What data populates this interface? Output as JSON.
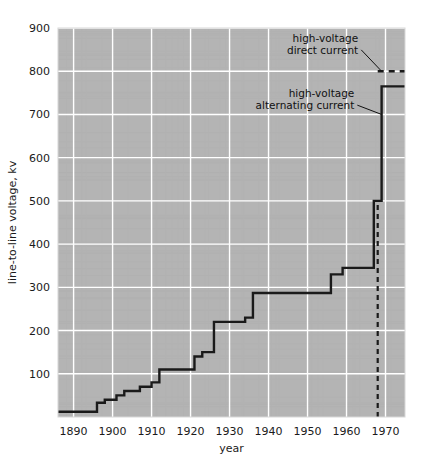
{
  "chart_data": {
    "type": "line",
    "title": "",
    "subtitle": "",
    "xlabel": "year",
    "ylabel": "line-to-line voltage, kv",
    "xlim": [
      1886,
      1975
    ],
    "ylim": [
      0,
      900
    ],
    "xticks": [
      1890,
      1900,
      1910,
      1920,
      1930,
      1940,
      1950,
      1960,
      1970
    ],
    "xticklabels": [
      "1890",
      "1900",
      "1910",
      "1920",
      "1930",
      "1940",
      "1950",
      "1960",
      "1970"
    ],
    "yticks": [
      100,
      200,
      300,
      400,
      500,
      600,
      700,
      800,
      900
    ],
    "yticklabels": [
      "100",
      "200",
      "300",
      "400",
      "500",
      "600",
      "700",
      "800",
      "900"
    ],
    "grid": true,
    "grid_color": "#ffffff",
    "plot_background": "#b4b4b4",
    "line_color": "#1a1a1a",
    "legend_position": "none",
    "drawstyle": "steps-post",
    "series": [
      {
        "name": "high-voltage alternating current",
        "style": "solid",
        "x": [
          1886,
          1893,
          1896,
          1898,
          1901,
          1903,
          1907,
          1910,
          1912,
          1913,
          1921,
          1923,
          1926,
          1934,
          1936,
          1953,
          1956,
          1959,
          1965,
          1967,
          1969,
          1975
        ],
        "values": [
          12,
          12,
          33,
          40,
          50,
          60,
          70,
          80,
          110,
          110,
          140,
          150,
          220,
          230,
          287,
          287,
          330,
          345,
          345,
          500,
          765,
          765
        ]
      },
      {
        "name": "high-voltage direct current",
        "style": "dashed",
        "x": [
          1968,
          1975
        ],
        "values": [
          800,
          800
        ]
      }
    ],
    "annotations": [
      {
        "name": "hvdc-annotation",
        "text_lines": [
          "high-voltage",
          "direct current"
        ],
        "text_x": 1963,
        "text_y": 868,
        "target_x": 1969,
        "target_y": 800
      },
      {
        "name": "hvac-annotation",
        "text_lines": [
          "high-voltage",
          "alternating current"
        ],
        "text_x": 1962,
        "text_y": 740,
        "target_x": 1969,
        "target_y": 700
      }
    ],
    "vertical_marker": {
      "name": "present-year-marker",
      "x": 1968,
      "style": "dashed",
      "y_from": 0,
      "y_to": 500
    }
  }
}
